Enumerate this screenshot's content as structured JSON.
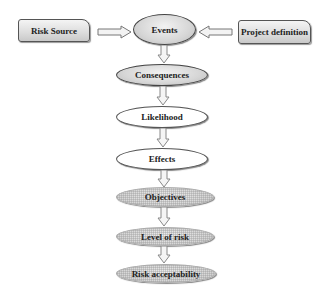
{
  "diagram": {
    "inputs": {
      "left": {
        "label": "Risk Source"
      },
      "right": {
        "label": "Project definition"
      }
    },
    "flow": [
      {
        "label": "Events",
        "style": "shaded"
      },
      {
        "label": "Consequences",
        "style": "shaded"
      },
      {
        "label": "Likelihood",
        "style": "white"
      },
      {
        "label": "Effects",
        "style": "white"
      },
      {
        "label": "Objectives",
        "style": "hatched"
      },
      {
        "label": "Level of risk",
        "style": "hatched"
      },
      {
        "label": "Risk acceptability",
        "style": "hatched"
      }
    ],
    "colors": {
      "outline": "#444444",
      "fill_shaded": "#d6d6d6",
      "fill_white": "#ffffff",
      "fill_hatched": "#d4d4d4",
      "arrow_outline": "#888888"
    }
  }
}
